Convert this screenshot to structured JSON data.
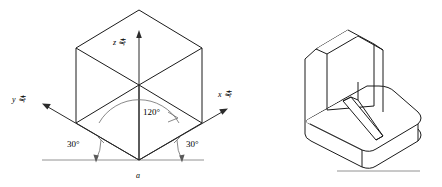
{
  "figure": {
    "background_color": "#ffffff",
    "line_color": "#1a1a1a",
    "arc_color": "#6b6b6b"
  },
  "left_diagram": {
    "name": "isometric-axes-cube",
    "axes": [
      {
        "id": "z",
        "letter": "z",
        "unit": "ì¶",
        "label": "z 축",
        "direction": "up"
      },
      {
        "id": "x",
        "letter": "x",
        "label": "x 축",
        "direction": "upper-right"
      },
      {
        "id": "y",
        "letter": "y",
        "label": "y 축",
        "direction": "upper-left"
      }
    ],
    "angles": [
      {
        "id": "between-axes",
        "value": "120°"
      },
      {
        "id": "left-from-horizontal",
        "value": "30°"
      },
      {
        "id": "right-from-horizontal",
        "value": "30°"
      }
    ],
    "origin_label": "a"
  },
  "right_diagram": {
    "name": "isometric-l-bracket",
    "features": [
      "vertical-wall",
      "horizontal-base",
      "triangular-gusset-rib",
      "chamfered-top-corners",
      "rounded-base-corners"
    ]
  }
}
